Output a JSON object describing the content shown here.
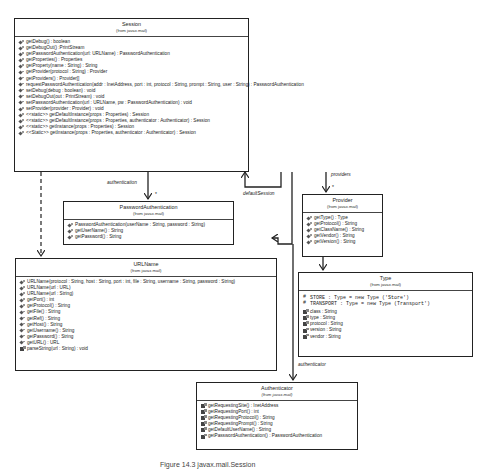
{
  "classes": {
    "session": {
      "name": "Session",
      "package": "(from javax.mail)",
      "methods": [
        "getDebug() : boolean",
        "getDebugOut() :PrintStream",
        "getPasswordAuthentication(url: URLName) : PasswordAuthentication",
        "getProperties() : Properties",
        "getProperty(name : String) : String",
        "getProvider(protocol : String) : Provider",
        "getProviders() : Provider[]",
        "requestPasswordAuthentication(addr : InetAddress, port : int, protocol : String, prompt : String, user : String) : PasswordAuthentication",
        "setDebug(debug : boolean) : void",
        "setDebugOut(out : PrintStream) : void",
        "setPasswordAuthentication(url : URLName, pw : PasswordAuthentication) : void",
        "setProvider(provider : Provider) : void",
        "<<static>> getDefaultInstance(props : Properties) : Session",
        "<<static>> getDefaultInstance(props : Properties, authenticator : Authenticator) : Session",
        "<<static>> getInstance(props : Properties) : Session",
        "<<Static>> getInstance(props : Properties, authenticator : Authenticator) : Session"
      ]
    },
    "password_authentication": {
      "name": "PasswordAuthentication",
      "package": "(from javax.mail)",
      "methods": [
        "PasswordAuthentication(userName : String, password : String)",
        "getUserName() : String",
        "getPassword() : String"
      ]
    },
    "provider": {
      "name": "Provider",
      "package": "(from javax.mail)",
      "methods": [
        "getType() : Type",
        "getProtocol() : String",
        "getClassName() : String",
        "getVendor() : String",
        "getVersion() : String"
      ]
    },
    "type": {
      "name": "Type",
      "package": "(from javax.mail)",
      "constants": [
        "STORE : Type = new Type ('Store')",
        "TRANSPORT : Type = new Type (Transport')"
      ],
      "attributes": [
        "class : String",
        "type : String",
        "protocol : String",
        "version : String",
        "vendor : String"
      ]
    },
    "urlname": {
      "name": "URLName",
      "package": "(from javax.mail)",
      "methods": [
        "URLName(protocol : String, host : String, port : int, file : String, username : String, password : String)",
        "URLName(url : URL)",
        "URLName(url : String)",
        "getPort() : int",
        "getProtocol() : String",
        "getFile() : String",
        "getRef() : String",
        "getHost() : String",
        "getUsername() : String",
        "getPassword() : String",
        "getURL() : URL"
      ],
      "private_methods": [
        "parseString(url : String) : void"
      ]
    },
    "authenticator": {
      "name": "Authenticator",
      "package": "(from javax.mail)",
      "methods": [
        "getRequestingSite() : InetAddress",
        "getRequestingPort() : int",
        "getRequestingProtocol() : String",
        "getRequestingPrompt() : String",
        "getDefaultUserName() : String",
        "getPasswordAuthentication() : PasswordAuthentication"
      ]
    }
  },
  "associations": {
    "authentication": "authentication",
    "default_session": "defaultSession",
    "providers": "providers",
    "authenticator": "authenticator",
    "multiplicity": "*"
  },
  "caption": "Figure 14.3 javax.mail.Session"
}
